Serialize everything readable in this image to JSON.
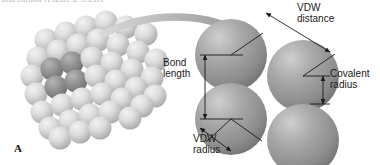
{
  "figure": {
    "panel_letter": "A",
    "clipped_header_text": "and carbon (Figure 2-5A,B).",
    "background_color": "#ffffff"
  },
  "labels": {
    "vdw_distance_line1": "VDW",
    "vdw_distance_line2": "distance",
    "bond_length_line1": "Bond",
    "bond_length_line2": "length",
    "covalent_radius_line1": "Covalent",
    "covalent_radius_line2": "radius",
    "vdw_radius_line1": "VDW",
    "vdw_radius_line2": "radius"
  },
  "colors": {
    "sphere_mid": "#9a9a9a",
    "sphere_light": "#d5d5d5",
    "sphere_dark": "#8a8a8a",
    "sphere_highlight": "#e8e8e8",
    "sphere_edge": "#6d6d6d",
    "arrow_curve": "#b0b0b0",
    "leader_line": "#1a1a1a",
    "text": "#1a1a1a"
  },
  "diagram": {
    "lattice_description": "space-filling crystal lattice cluster of stacked spheres",
    "detail_description": "four overlapping spheres in two touching pairs"
  }
}
